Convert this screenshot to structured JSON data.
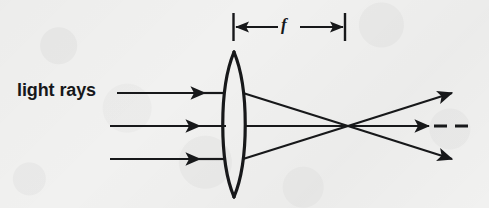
{
  "figure": {
    "background_color": "#f1f1f0",
    "ink_color": "#17181a",
    "labels": {
      "light_rays": "light rays",
      "focal_length": "f"
    },
    "lens": {
      "type": "biconvex converging lens",
      "center_x": 234,
      "top_y": 52,
      "bottom_y": 197,
      "half_width": 12
    },
    "optical_axis_y": 126,
    "focal_point": {
      "x": 348,
      "y": 126
    },
    "incoming_rays": [
      {
        "name": "upper-ray",
        "y": 93,
        "start_x": 117,
        "arrow_x": 205
      },
      {
        "name": "axis-ray",
        "y": 126,
        "start_x": 110,
        "arrow_x": 200
      },
      {
        "name": "lower-ray",
        "y": 159,
        "start_x": 110,
        "arrow_x": 200
      }
    ],
    "outgoing_rays": [
      {
        "name": "upper-refracted-ray",
        "from_x": 243,
        "from_y": 93,
        "to_x": 452,
        "to_y": 93
      },
      {
        "name": "axis-refracted-ray",
        "from_x": 246,
        "from_y": 126,
        "to_x": 458,
        "to_y": 126
      },
      {
        "name": "lower-refracted-ray",
        "from_x": 243,
        "from_y": 159,
        "to_x": 452,
        "to_y": 159
      }
    ],
    "dashes": [
      {
        "x1": 434,
        "x2": 447,
        "y": 126
      },
      {
        "x1": 455,
        "x2": 468,
        "y": 126
      }
    ],
    "dimension_line": {
      "label": "f",
      "left_tick_x": 233,
      "right_tick_x": 345,
      "tick_top_y": 13,
      "tick_bottom_y": 41,
      "arrow_y": 27
    }
  }
}
